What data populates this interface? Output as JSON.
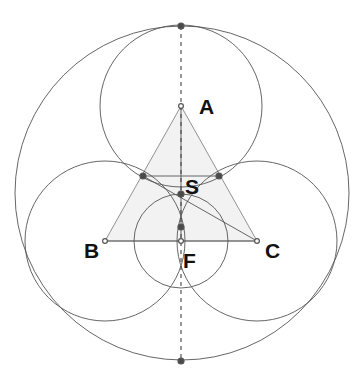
{
  "figure": {
    "background_color": "#ffffff",
    "width": 364,
    "height": 380,
    "stroke_color": "#555555",
    "triangle_fill": "#f2f2f2",
    "point_color": "#555555",
    "label_color": "#111111"
  },
  "labels": {
    "a": "A",
    "b": "B",
    "c": "C",
    "s": "S",
    "f": "F"
  },
  "chart_data": {
    "type": "diagram",
    "points": [
      {
        "name": "A",
        "x": 181,
        "y": 106,
        "label": "A",
        "label_x": 199,
        "label_y": 108
      },
      {
        "name": "B",
        "x": 105,
        "y": 241,
        "label": "B",
        "label_x": 84,
        "label_y": 252
      },
      {
        "name": "C",
        "x": 257,
        "y": 241,
        "label": "C",
        "label_x": 265,
        "label_y": 252
      },
      {
        "name": "S",
        "x": 181,
        "y": 194,
        "label": "S",
        "label_x": 185,
        "label_y": 188
      },
      {
        "name": "F",
        "x": 181,
        "y": 241,
        "label": "F",
        "label_x": 183,
        "label_y": 262
      },
      {
        "name": "T_top",
        "x": 181,
        "y": 26,
        "label": "",
        "label_x": 0,
        "label_y": 0
      },
      {
        "name": "T_bottom",
        "x": 181,
        "y": 361,
        "label": "",
        "label_x": 0,
        "label_y": 0
      },
      {
        "name": "T_AB",
        "x": 143,
        "y": 176,
        "label": "",
        "label_x": 0,
        "label_y": 0
      },
      {
        "name": "T_AC",
        "x": 219,
        "y": 176,
        "label": "",
        "label_x": 0,
        "label_y": 0
      },
      {
        "name": "P_mid",
        "x": 181,
        "y": 227,
        "label": "",
        "label_x": 0,
        "label_y": 0
      }
    ],
    "circles": [
      {
        "name": "outer-circle",
        "cx": 182,
        "cy": 193,
        "r": 167
      },
      {
        "name": "circle-A",
        "cx": 181,
        "cy": 106,
        "r": 81
      },
      {
        "name": "circle-B",
        "cx": 105,
        "cy": 241,
        "r": 80
      },
      {
        "name": "circle-C",
        "cx": 257,
        "cy": 241,
        "r": 80
      },
      {
        "name": "arc-small",
        "cx": 181,
        "cy": 241,
        "r": 47
      }
    ],
    "triangle": {
      "name": "triangle-ABC",
      "vertices": "181,106 105,241 257,241"
    },
    "segments": [
      {
        "name": "segment-BC",
        "x1": 105,
        "y1": 241,
        "x2": 257,
        "y2": 241
      },
      {
        "name": "segment-AF",
        "x1": 181,
        "y1": 106,
        "x2": 181,
        "y2": 241
      },
      {
        "name": "segment-TAB-C",
        "x1": 143,
        "y1": 176,
        "x2": 257,
        "y2": 241
      },
      {
        "name": "segment-TAB-TAC",
        "x1": 143,
        "y1": 176,
        "x2": 219,
        "y2": 176
      }
    ],
    "dashed_axis": {
      "name": "vertical-axis",
      "x1": 181,
      "y1": 26,
      "x2": 181,
      "y2": 361
    }
  }
}
